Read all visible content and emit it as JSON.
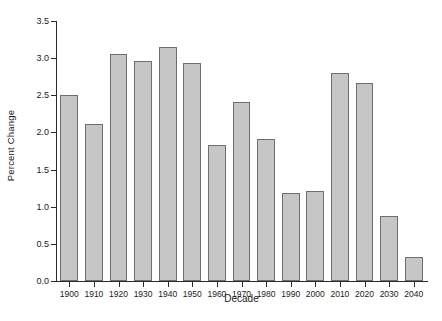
{
  "chart_data": {
    "type": "bar",
    "title": "",
    "xlabel": "Decade",
    "ylabel": "Percent Change",
    "categories": [
      "1900",
      "1910",
      "1920",
      "1930",
      "1940",
      "1950",
      "1960",
      "1970",
      "1980",
      "1990",
      "2000",
      "2010",
      "2020",
      "2030",
      "2040"
    ],
    "values": [
      2.51,
      2.11,
      3.06,
      2.96,
      3.15,
      2.93,
      1.83,
      2.41,
      1.91,
      1.18,
      1.21,
      2.8,
      2.67,
      0.87,
      0.33
    ],
    "ylim": [
      0.0,
      3.5
    ],
    "ytick_labels": [
      "0.0",
      "0.5",
      "1.0",
      "1.5",
      "2.0",
      "2.5",
      "3.0",
      "3.5"
    ],
    "ytick_values": [
      0.0,
      0.5,
      1.0,
      1.5,
      2.0,
      2.5,
      3.0,
      3.5
    ],
    "grid": false,
    "legend": null,
    "bar_color": "#c6c6c6",
    "bar_edge_color": "#6e6e6e",
    "axis_color": "#2b2b2b",
    "background": "#ffffff"
  }
}
